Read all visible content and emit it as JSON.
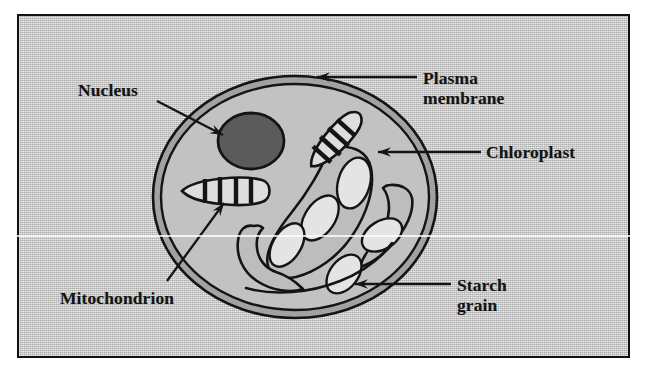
{
  "figure": {
    "kind": "labelled-diagram",
    "caption": "",
    "frame": {
      "border_color": "#121212",
      "plate_color": "#c9c9c9"
    }
  },
  "colors": {
    "ink": "#141414",
    "plate_background": "#c9c9c9",
    "cytoplasm": "#c2c2c2",
    "plasma_membrane_band": "#9a9a9a",
    "nucleus_fill": "#5b5b5b",
    "organelle_fill": "#bdbdbd",
    "starch_grain_fill": "#e2e2e2",
    "mitochondrion_fill": "#dddddd"
  },
  "labels": [
    {
      "id": "nucleus",
      "name": "nucleus-label",
      "lines": [
        "Nucleus"
      ],
      "text": "Nucleus",
      "x": 78,
      "y": 80,
      "pointer": "arrow",
      "points_to": "nucleus-organelle"
    },
    {
      "id": "plasma-membrane",
      "name": "plasma-membrane-label",
      "lines": [
        "Plasma",
        "membrane"
      ],
      "text": "Plasma membrane",
      "x": 423,
      "y": 68,
      "pointer": "arrow",
      "points_to": "plasma-membrane-boundary"
    },
    {
      "id": "chloroplast",
      "name": "chloroplast-label",
      "lines": [
        "Chloroplast"
      ],
      "text": "Chloroplast",
      "x": 486,
      "y": 142,
      "pointer": "arrow",
      "points_to": "chloroplast-organelle"
    },
    {
      "id": "starch-grain",
      "name": "starch-grain-label",
      "lines": [
        "Starch",
        "grain"
      ],
      "text": "Starch grain",
      "x": 457,
      "y": 275,
      "pointer": "arrow",
      "points_to": "starch-grain-organelle"
    },
    {
      "id": "mitochondrion",
      "name": "mitochondrion-label",
      "lines": [
        "Mitochondrion"
      ],
      "text": "Mitochondrion",
      "x": 60,
      "y": 288,
      "pointer": "arrow",
      "points_to": "mitochondrion-organelle"
    }
  ],
  "structures": [
    {
      "id": "plasma-membrane-boundary",
      "label": "Plasma membrane",
      "count": 1,
      "shape": "double-line ring around the cell"
    },
    {
      "id": "cytoplasm",
      "label": "Cytoplasm",
      "count": 1,
      "shape": "grey interior fill"
    },
    {
      "id": "nucleus-organelle",
      "label": "Nucleus",
      "count": 1,
      "shape": "dark filled circle, upper left of cell"
    },
    {
      "id": "mitochondrion-organelle",
      "label": "Mitochondrion",
      "count": 2,
      "shape": "lens / rod outline with internal cristae bars"
    },
    {
      "id": "chloroplast-organelle",
      "label": "Chloroplast",
      "count": 3,
      "shape": "large curved kidney outline"
    },
    {
      "id": "starch-grain-organelle",
      "label": "Starch grain",
      "count": 5,
      "shape": "pale oval inside the chloroplasts"
    }
  ]
}
